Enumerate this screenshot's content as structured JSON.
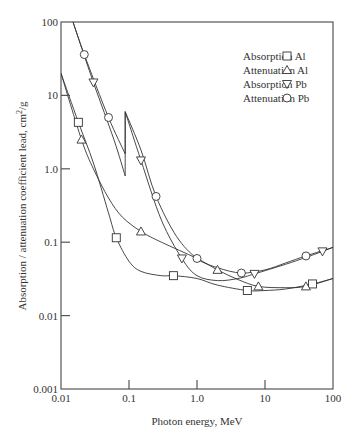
{
  "chart_data": {
    "type": "line",
    "title": "",
    "xlabel": "Photon energy, MeV",
    "ylabel": "Absorption / attenuation coefficient lead, cm²/g",
    "xscale": "log",
    "yscale": "log",
    "xlim": [
      0.01,
      100
    ],
    "ylim": [
      0.001,
      100
    ],
    "grid": false,
    "legend_position": "upper right",
    "x_ticks": [
      "0.01",
      "0.1",
      "1.0",
      "10",
      "100"
    ],
    "y_ticks": [
      "100",
      "10",
      "1.0",
      "0.1",
      "0.01",
      "0.001"
    ],
    "series": [
      {
        "name": "Absorption Al",
        "marker": "square",
        "markers": [
          [
            0.018,
            4.3
          ],
          [
            0.065,
            0.115
          ],
          [
            0.45,
            0.035
          ],
          [
            5.5,
            0.022
          ],
          [
            50,
            0.027
          ]
        ],
        "curve": [
          [
            0.01,
            20
          ],
          [
            0.018,
            4.3
          ],
          [
            0.03,
            1.2
          ],
          [
            0.05,
            0.25
          ],
          [
            0.065,
            0.115
          ],
          [
            0.1,
            0.055
          ],
          [
            0.15,
            0.04
          ],
          [
            0.3,
            0.035
          ],
          [
            0.45,
            0.035
          ],
          [
            1.0,
            0.032
          ],
          [
            2.0,
            0.026
          ],
          [
            5.5,
            0.022
          ],
          [
            10,
            0.022
          ],
          [
            20,
            0.023
          ],
          [
            50,
            0.027
          ],
          [
            100,
            0.032
          ]
        ]
      },
      {
        "name": "Attenuation Al",
        "marker": "triangle-up",
        "markers": [
          [
            0.02,
            2.5
          ],
          [
            0.15,
            0.14
          ],
          [
            2.0,
            0.042
          ],
          [
            8.0,
            0.025
          ],
          [
            40,
            0.025
          ]
        ],
        "curve": [
          [
            0.01,
            20
          ],
          [
            0.02,
            2.5
          ],
          [
            0.03,
            1.0
          ],
          [
            0.05,
            0.4
          ],
          [
            0.08,
            0.22
          ],
          [
            0.15,
            0.14
          ],
          [
            0.3,
            0.1
          ],
          [
            1.0,
            0.06
          ],
          [
            2.0,
            0.042
          ],
          [
            4.0,
            0.031
          ],
          [
            8.0,
            0.025
          ],
          [
            20,
            0.024
          ],
          [
            40,
            0.025
          ],
          [
            100,
            0.032
          ]
        ]
      },
      {
        "name": "Absorption Pb",
        "marker": "triangle-down",
        "markers": [
          [
            0.03,
            15
          ],
          [
            0.15,
            1.3
          ],
          [
            0.6,
            0.06
          ],
          [
            7.0,
            0.037
          ],
          [
            70,
            0.075
          ]
        ],
        "curve": [
          [
            0.015,
            100
          ],
          [
            0.03,
            15
          ],
          [
            0.06,
            2.5
          ],
          [
            0.088,
            0.8
          ],
          [
            0.088,
            6.0
          ],
          [
            0.15,
            1.3
          ],
          [
            0.3,
            0.2
          ],
          [
            0.6,
            0.06
          ],
          [
            1.0,
            0.035
          ],
          [
            2.0,
            0.03
          ],
          [
            4.0,
            0.032
          ],
          [
            7.0,
            0.037
          ],
          [
            20,
            0.05
          ],
          [
            40,
            0.062
          ],
          [
            70,
            0.075
          ],
          [
            100,
            0.085
          ]
        ]
      },
      {
        "name": "Attenuation Pb",
        "marker": "circle",
        "markers": [
          [
            0.022,
            36
          ],
          [
            0.05,
            5
          ],
          [
            0.25,
            0.42
          ],
          [
            1.0,
            0.06
          ],
          [
            4.5,
            0.038
          ],
          [
            40,
            0.065
          ]
        ],
        "curve": [
          [
            0.015,
            100
          ],
          [
            0.022,
            36
          ],
          [
            0.05,
            5
          ],
          [
            0.088,
            1.6
          ],
          [
            0.088,
            6.0
          ],
          [
            0.15,
            1.8
          ],
          [
            0.25,
            0.42
          ],
          [
            0.5,
            0.12
          ],
          [
            1.0,
            0.06
          ],
          [
            2.0,
            0.045
          ],
          [
            4.5,
            0.038
          ],
          [
            10,
            0.042
          ],
          [
            20,
            0.052
          ],
          [
            40,
            0.065
          ],
          [
            100,
            0.085
          ]
        ]
      }
    ]
  },
  "legend": {
    "items": [
      {
        "label": "Absorption Al",
        "symbol": "□"
      },
      {
        "label": "Attenuation Al",
        "symbol": "△"
      },
      {
        "label": "Absorption Pb",
        "symbol": "▽"
      },
      {
        "label": "Attenuation Pb",
        "symbol": "○"
      }
    ]
  },
  "axes": {
    "x_title": "Photon energy, MeV",
    "y_title_main": "Absorption / attenuation coefficient lead, cm",
    "y_title_sup": "2",
    "y_title_end": "/g"
  }
}
